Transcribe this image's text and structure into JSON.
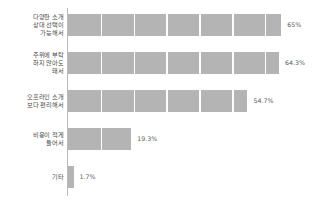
{
  "chart_data": {
    "type": "bar",
    "orientation": "horizontal",
    "title": "",
    "subtitle": "",
    "xlabel": "",
    "ylabel": "",
    "xlim": [
      0,
      70
    ],
    "grid": true,
    "grid_interval": 10,
    "legend": "none",
    "categories": [
      "다양한 소개\n상대 선택이\n가능해서",
      "주위에 부탁\n하지 않아도\n돼서",
      "오프라인 소개\n보다 편리해서",
      "비용이 적게\n들어서",
      "기타"
    ],
    "values": [
      65,
      64.3,
      54.7,
      19.3,
      1.7
    ],
    "value_labels": [
      "65%",
      "64.3%",
      "54.7%",
      "19.3%",
      "1.7%"
    ],
    "bar_color": "#b4b4b4",
    "axis_color": "#b9b9b9",
    "label_color": "#4a4a4a",
    "value_color": "#5a5a5a",
    "background": "#ffffff"
  }
}
